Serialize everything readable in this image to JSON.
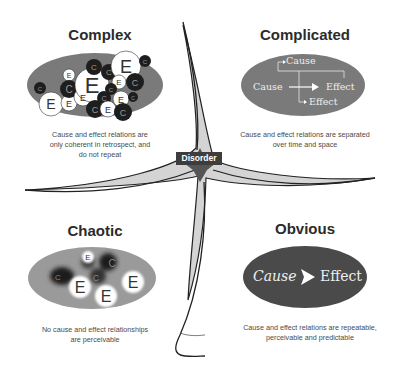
{
  "diagram": {
    "name": "Cynefin framework",
    "center": {
      "label": "Disorder"
    },
    "domains": [
      {
        "id": "complex",
        "title": "Complex",
        "description_lines": [
          "Cause and effect relations are",
          "only coherent in retrospect, and",
          "do not repeat"
        ],
        "illustration": {
          "type": "tangled-circles",
          "labels": [
            "E",
            "C"
          ]
        }
      },
      {
        "id": "complicated",
        "title": "Complicated",
        "description_lines": [
          "Cause and effect relations are separated",
          "over time and space"
        ],
        "illustration": {
          "type": "branching-arrows",
          "labels": {
            "top": "Cause",
            "left": "Cause",
            "right": "Effect",
            "bottom": "Effect"
          }
        }
      },
      {
        "id": "chaotic",
        "title": "Chaotic",
        "description_lines": [
          "No cause and effect relationships",
          "are perceivable"
        ],
        "illustration": {
          "type": "blurred-circles",
          "labels": [
            "E",
            "C"
          ]
        }
      },
      {
        "id": "obvious",
        "title": "Obvious",
        "description_lines": [
          "Cause and effect relations are repeatable,",
          "perceivable and predictable"
        ],
        "illustration": {
          "type": "single-arrow",
          "labels": {
            "cause": "Cause",
            "effect": "Effect"
          }
        }
      }
    ],
    "colors": {
      "ellipse_light": "#7a7a7a",
      "ellipse_dark": "#4a4a4a",
      "circle_dark": "#1e1e1e",
      "circle_light": "#ffffff",
      "center_fill": "#cfcfcf",
      "center_star": "#555555",
      "label_bg": "#3d3d3d",
      "text": "#2b2b2b"
    }
  }
}
